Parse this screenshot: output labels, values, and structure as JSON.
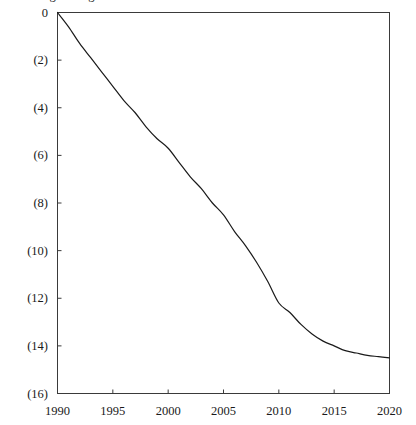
{
  "chart_data": {
    "type": "line",
    "title": "Average change",
    "title_clipped": true,
    "xlabel": "",
    "ylabel": "",
    "x": [
      1990,
      1991,
      1992,
      1993,
      1994,
      1995,
      1996,
      1997,
      1998,
      1999,
      2000,
      2001,
      2002,
      2003,
      2004,
      2005,
      2006,
      2007,
      2008,
      2009,
      2010,
      2011,
      2012,
      2013,
      2014,
      2015,
      2016,
      2017,
      2018,
      2019,
      2020
    ],
    "values": [
      0.0,
      -0.6,
      -1.3,
      -1.9,
      -2.5,
      -3.1,
      -3.7,
      -4.2,
      -4.8,
      -5.3,
      -5.7,
      -6.3,
      -6.9,
      -7.4,
      -8.0,
      -8.5,
      -9.2,
      -9.8,
      -10.5,
      -11.3,
      -12.2,
      -12.6,
      -13.1,
      -13.5,
      -13.8,
      -14.0,
      -14.2,
      -14.3,
      -14.4,
      -14.45,
      -14.5
    ],
    "series": [
      {
        "name": "series-1",
        "color": "#1a1a1a",
        "values": [
          0.0,
          -0.6,
          -1.3,
          -1.9,
          -2.5,
          -3.1,
          -3.7,
          -4.2,
          -4.8,
          -5.3,
          -5.7,
          -6.3,
          -6.9,
          -7.4,
          -8.0,
          -8.5,
          -9.2,
          -9.8,
          -10.5,
          -11.3,
          -12.2,
          -12.6,
          -13.1,
          -13.5,
          -13.8,
          -14.0,
          -14.2,
          -14.3,
          -14.4,
          -14.45,
          -14.5
        ]
      }
    ],
    "xlim": [
      1990,
      2020
    ],
    "ylim": [
      -16,
      0
    ],
    "x_ticks": [
      1990,
      1995,
      2000,
      2005,
      2010,
      2015,
      2020
    ],
    "x_tick_labels": [
      "1990",
      "1995",
      "2000",
      "2005",
      "2010",
      "2015",
      "2020"
    ],
    "y_ticks": [
      0,
      -2,
      -4,
      -6,
      -8,
      -10,
      -12,
      -14,
      -16
    ],
    "y_tick_labels": [
      "0",
      "(2)",
      "(4)",
      "(6)",
      "(8)",
      "(10)",
      "(12)",
      "(14)",
      "(16)"
    ],
    "grid": false,
    "legend": false,
    "legend_position": "none",
    "axis_color": "#3a3a3a",
    "line_color": "#1a1a1a",
    "background": "#ffffff",
    "note": "Negative values shown in accounting parentheses notation"
  }
}
